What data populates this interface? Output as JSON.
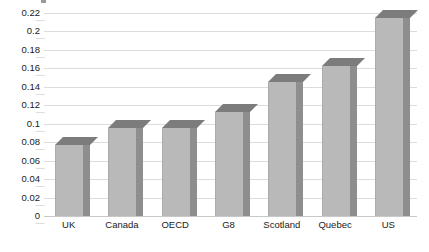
{
  "chart_data": {
    "type": "bar",
    "title": "",
    "subtitle": "",
    "xlabel": "",
    "ylabel": "",
    "categories": [
      "UK",
      "Canada",
      "OECD",
      "G8",
      "Scotland",
      "Quebec",
      "US"
    ],
    "values": [
      0.077,
      0.095,
      0.095,
      0.113,
      0.145,
      0.163,
      0.215
    ],
    "series": [
      {
        "name": "",
        "values": [
          0.077,
          0.095,
          0.095,
          0.113,
          0.145,
          0.163,
          0.215
        ]
      }
    ],
    "ylim": [
      0,
      0.22
    ],
    "ytick_values": [
      0,
      0.02,
      0.04,
      0.06,
      0.08,
      0.1,
      0.12,
      0.14,
      0.16,
      0.18,
      0.2,
      0.22
    ],
    "ytick_labels": [
      "0",
      "0.02",
      "0.04",
      "0.06",
      "0.08",
      "0.1",
      "0.12",
      "0.14",
      "0.16",
      "0.18",
      "0.2",
      "0.22"
    ],
    "grid": true,
    "grid_axis": "y",
    "legend": false,
    "legend_position": "none",
    "style": "3d-column",
    "colors": {
      "bar_front": "#b9b9b9",
      "bar_side": "#8e8e8e",
      "bar_top": "#7c7c7c",
      "gridline": "#dcdcdc",
      "baseline": "#c8c8c8",
      "text": "#1a1a1a",
      "background": "#ffffff"
    }
  },
  "axes": {
    "y": {
      "ticks": [
        {
          "label": "0.22",
          "value": 0.22
        },
        {
          "label": "0.2",
          "value": 0.2
        },
        {
          "label": "0.18",
          "value": 0.18
        },
        {
          "label": "0.16",
          "value": 0.16
        },
        {
          "label": "0.14",
          "value": 0.14
        },
        {
          "label": "0.12",
          "value": 0.12
        },
        {
          "label": "0.1",
          "value": 0.1
        },
        {
          "label": "0.08",
          "value": 0.08
        },
        {
          "label": "0.06",
          "value": 0.06
        },
        {
          "label": "0.04",
          "value": 0.04
        },
        {
          "label": "0.02",
          "value": 0.02
        },
        {
          "label": "0",
          "value": 0
        }
      ]
    },
    "x": {
      "ticks": [
        {
          "label": "UK"
        },
        {
          "label": "Canada"
        },
        {
          "label": "OECD"
        },
        {
          "label": "G8"
        },
        {
          "label": "Scotland"
        },
        {
          "label": "Quebec"
        },
        {
          "label": "US"
        }
      ]
    }
  }
}
